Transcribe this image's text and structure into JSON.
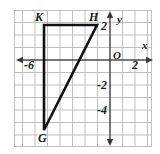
{
  "figure": {
    "background_color": "#ffffff",
    "grid_color": "#b9b9bd",
    "axis_color": "#4a4a4a",
    "shape_color": "#111111",
    "grid": {
      "left_px": 14,
      "top_px": 10,
      "right_px": 152,
      "bottom_px": 147,
      "cell_px": 12.5,
      "origin_x_px": 110,
      "origin_y_px": 60
    },
    "axes": {
      "x_label": "x",
      "y_label": "y",
      "origin_label": "O",
      "x_ticks": [
        {
          "label": "-6",
          "value": -6
        },
        {
          "label": "2",
          "value": 2
        }
      ],
      "y_ticks": [
        {
          "label": "2",
          "value": 2
        },
        {
          "label": "-2",
          "value": -2
        },
        {
          "label": "-4",
          "value": -4
        }
      ],
      "x_range": [
        -7.7,
        3.4
      ],
      "y_range": [
        -7.0,
        4.0
      ],
      "arrows": [
        "left",
        "right",
        "up",
        "down"
      ]
    },
    "shape": {
      "name": "triangle-GHK",
      "type": "triangle",
      "vertices": [
        {
          "label": "K",
          "x": -5.3,
          "y": 2.8,
          "px": 44,
          "py": 25
        },
        {
          "label": "H",
          "x": -1.0,
          "y": 2.8,
          "px": 97,
          "py": 25
        },
        {
          "label": "G",
          "x": -5.3,
          "y": -5.6,
          "px": 44,
          "py": 130
        }
      ],
      "edges": [
        "K-H",
        "H-G",
        "G-K"
      ],
      "stroke_width": 2.6,
      "fill": "none"
    },
    "vertex_labels": [
      {
        "name": "K",
        "text": "K",
        "px": 36,
        "py": 12
      },
      {
        "name": "H",
        "text": "H",
        "px": 90,
        "py": 12
      },
      {
        "name": "G",
        "text": "G",
        "px": 38,
        "py": 133
      }
    ]
  }
}
